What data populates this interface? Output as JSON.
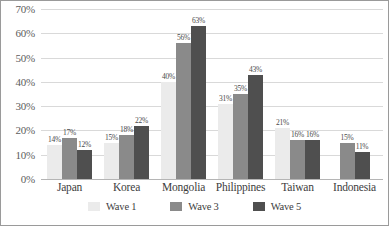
{
  "chart_data": {
    "type": "bar",
    "title": "",
    "subtitle": "",
    "xlabel": "",
    "ylabel": "",
    "ylim": [
      0,
      70
    ],
    "ytick_labels": [
      "0%",
      "10%",
      "20%",
      "30%",
      "40%",
      "50%",
      "60%",
      "70%"
    ],
    "ytick_values": [
      0,
      10,
      20,
      30,
      40,
      50,
      60,
      70
    ],
    "grid": true,
    "legend_position": "bottom",
    "categories": [
      "Japan",
      "Korea",
      "Mongolia",
      "Philippines",
      "Taiwan",
      "Indonesia"
    ],
    "series": [
      {
        "name": "Wave 1",
        "color": "#ebebeb",
        "values": [
          14,
          15,
          40,
          31,
          21,
          null
        ],
        "labels": [
          "14%",
          "15%",
          "40%",
          "31%",
          "21%",
          ""
        ]
      },
      {
        "name": "Wave 3",
        "color": "#8a8a8a",
        "values": [
          17,
          18,
          56,
          35,
          16,
          15
        ],
        "labels": [
          "17%",
          "18%",
          "56%",
          "35%",
          "16%",
          "15%"
        ]
      },
      {
        "name": "Wave 5",
        "color": "#4f4f4f",
        "values": [
          12,
          22,
          63,
          43,
          16,
          11
        ],
        "labels": [
          "12%",
          "22%",
          "63%",
          "43%",
          "16%",
          "11%"
        ]
      }
    ]
  },
  "legend": {
    "items": [
      {
        "label": "Wave 1",
        "color": "#ebebeb"
      },
      {
        "label": "Wave 3",
        "color": "#8a8a8a"
      },
      {
        "label": "Wave 5",
        "color": "#4f4f4f"
      }
    ]
  },
  "style": {
    "gridline_color": "#d9d9d9",
    "border_color": "#9a9a9a",
    "background": "#ffffff",
    "label_color": "#4a4a4a"
  }
}
